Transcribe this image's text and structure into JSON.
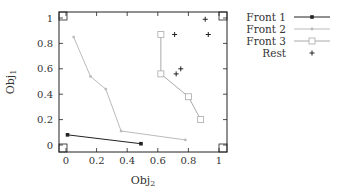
{
  "chart_data": {
    "type": "line",
    "title": "",
    "xlabel": "Obj2",
    "ylabel": "Obj1",
    "xlim": [
      -0.04,
      1.05
    ],
    "ylim": [
      -0.05,
      1.05
    ],
    "xticks": [
      "0",
      "0.2",
      "0.4",
      "0.6",
      "0.8",
      "1"
    ],
    "yticks": [
      "0",
      "0.2",
      "0.4",
      "0.6",
      "0.8",
      "1"
    ],
    "grid": false,
    "legend_position": "outside-right-top",
    "series": [
      {
        "name": "Front 1",
        "marker": "filled-square",
        "color": "#222222",
        "line": true,
        "points": [
          [
            0.01,
            0.08
          ],
          [
            0.49,
            0.01
          ]
        ]
      },
      {
        "name": "Front 2",
        "marker": "small-dot",
        "color": "#bbbbbb",
        "line": true,
        "points": [
          [
            0.05,
            0.85
          ],
          [
            0.16,
            0.54
          ],
          [
            0.26,
            0.44
          ],
          [
            0.36,
            0.11
          ],
          [
            0.78,
            0.04
          ]
        ]
      },
      {
        "name": "Front 3",
        "marker": "open-square",
        "color": "#aaaaaa",
        "line": true,
        "points": [
          [
            0.62,
            0.87
          ],
          [
            0.62,
            0.56
          ],
          [
            0.8,
            0.38
          ],
          [
            0.88,
            0.2
          ]
        ]
      },
      {
        "name": "Rest",
        "marker": "plus",
        "color": "#222222",
        "line": false,
        "points": [
          [
            0.91,
            0.99
          ],
          [
            0.93,
            0.87
          ],
          [
            0.71,
            0.87
          ],
          [
            0.75,
            0.6
          ],
          [
            0.72,
            0.56
          ]
        ]
      }
    ]
  },
  "axes": {
    "xlabel_main": "Obj",
    "xlabel_sub": "2",
    "ylabel_main": "Obj",
    "ylabel_sub": "1"
  },
  "legend": {
    "items": [
      "Front 1",
      "Front 2",
      "Front 3",
      "Rest"
    ]
  }
}
